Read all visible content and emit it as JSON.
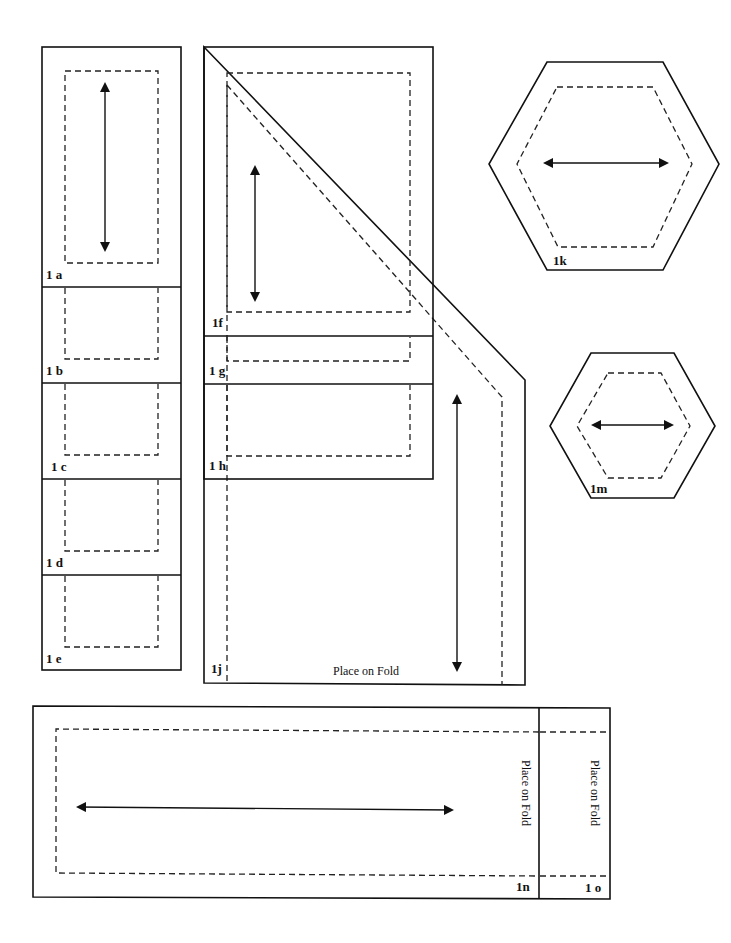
{
  "document": {
    "title": "Quilt pattern pieces",
    "colors": {
      "line": "#111111",
      "background": "#ffffff"
    }
  },
  "pieces": {
    "a": {
      "label": "1 a"
    },
    "b": {
      "label": "1 b"
    },
    "c": {
      "label": "1 c"
    },
    "d": {
      "label": "1 d"
    },
    "e": {
      "label": "1 e"
    },
    "f": {
      "label": "1f"
    },
    "g": {
      "label": "1 g"
    },
    "h": {
      "label": "1 h"
    },
    "j": {
      "label": "1j",
      "fold_text": "Place on Fold"
    },
    "k": {
      "label": "1k"
    },
    "m": {
      "label": "1m"
    },
    "n": {
      "label": "1n",
      "fold_text": "Place on Fold"
    },
    "o": {
      "label": "1 o",
      "fold_text": "Place on Fold"
    }
  },
  "legend": {
    "solid_line": "cutting line",
    "dashed_line": "seam line",
    "double_arrow": "grain line"
  }
}
